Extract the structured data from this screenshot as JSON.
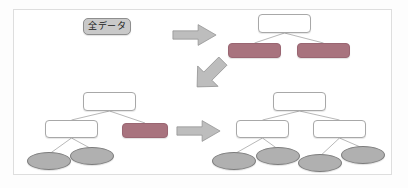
{
  "figure": {
    "title_label": "全データ",
    "colors": {
      "node_white_fill": "#ffffff",
      "node_white_stroke": "#a8a8a8",
      "node_rose_fill": "#a8737e",
      "node_rose_stroke": "#9a6672",
      "leaf_fill": "#b0b0b0",
      "leaf_stroke": "#7d7d7d",
      "arrow_fill": "#bdbdbd",
      "arrow_stroke": "#8f8f8f",
      "tag_fill": "#c9c9c9",
      "frame_stroke": "#dedede",
      "background": "#ffffff",
      "edge_stroke": "#9a9a9a"
    },
    "trees": [
      {
        "id": "tree-top-right",
        "caption": "",
        "nodes": [
          {
            "id": "tr-root",
            "kind": "rect",
            "fill": "white",
            "label": "",
            "x": 258,
            "y": 14,
            "w": 53,
            "h": 19
          },
          {
            "id": "tr-left",
            "kind": "rect",
            "fill": "rose",
            "label": "",
            "x": 228,
            "y": 43,
            "w": 53,
            "h": 15
          },
          {
            "id": "tr-right",
            "kind": "rect",
            "fill": "rose",
            "label": "",
            "x": 297,
            "y": 43,
            "w": 53,
            "h": 15
          }
        ],
        "edges": [
          {
            "from": "tr-root",
            "to": "tr-left"
          },
          {
            "from": "tr-root",
            "to": "tr-right"
          }
        ]
      },
      {
        "id": "tree-bottom-left",
        "caption": "",
        "nodes": [
          {
            "id": "bl-root",
            "kind": "rect",
            "fill": "white",
            "label": "",
            "x": 83,
            "y": 92,
            "w": 53,
            "h": 19
          },
          {
            "id": "bl-left",
            "kind": "rect",
            "fill": "white",
            "label": "",
            "x": 45,
            "y": 120,
            "w": 53,
            "h": 18
          },
          {
            "id": "bl-right",
            "kind": "rect",
            "fill": "rose",
            "label": "",
            "x": 122,
            "y": 123,
            "w": 46,
            "h": 15
          },
          {
            "id": "bl-leaf1",
            "kind": "ellipse",
            "fill": "gray",
            "label": "",
            "x": 27,
            "y": 152,
            "w": 44,
            "h": 18
          },
          {
            "id": "bl-leaf2",
            "kind": "ellipse",
            "fill": "gray",
            "label": "",
            "x": 70,
            "y": 147,
            "w": 44,
            "h": 18
          }
        ],
        "edges": [
          {
            "from": "bl-root",
            "to": "bl-left"
          },
          {
            "from": "bl-root",
            "to": "bl-right"
          },
          {
            "from": "bl-left",
            "to": "bl-leaf1"
          },
          {
            "from": "bl-left",
            "to": "bl-leaf2"
          }
        ]
      },
      {
        "id": "tree-bottom-right",
        "caption": "",
        "nodes": [
          {
            "id": "br-root",
            "kind": "rect",
            "fill": "white",
            "label": "",
            "x": 273,
            "y": 92,
            "w": 53,
            "h": 19
          },
          {
            "id": "br-left",
            "kind": "rect",
            "fill": "white",
            "label": "",
            "x": 236,
            "y": 120,
            "w": 53,
            "h": 18
          },
          {
            "id": "br-right",
            "kind": "rect",
            "fill": "white",
            "label": "",
            "x": 313,
            "y": 120,
            "w": 53,
            "h": 18
          },
          {
            "id": "br-leaf1",
            "kind": "ellipse",
            "fill": "gray",
            "label": "",
            "x": 212,
            "y": 152,
            "w": 44,
            "h": 18
          },
          {
            "id": "br-leaf2",
            "kind": "ellipse",
            "fill": "gray",
            "label": "",
            "x": 256,
            "y": 147,
            "w": 44,
            "h": 18
          },
          {
            "id": "br-leaf3",
            "kind": "ellipse",
            "fill": "gray",
            "label": "",
            "x": 298,
            "y": 154,
            "w": 44,
            "h": 18
          },
          {
            "id": "br-leaf4",
            "kind": "ellipse",
            "fill": "gray",
            "label": "",
            "x": 341,
            "y": 146,
            "w": 44,
            "h": 18
          }
        ],
        "edges": [
          {
            "from": "br-root",
            "to": "br-left"
          },
          {
            "from": "br-root",
            "to": "br-right"
          },
          {
            "from": "br-left",
            "to": "br-leaf1"
          },
          {
            "from": "br-left",
            "to": "br-leaf2"
          },
          {
            "from": "br-right",
            "to": "br-leaf3"
          },
          {
            "from": "br-right",
            "to": "br-leaf4"
          }
        ]
      }
    ],
    "arrows": [
      {
        "id": "arrow-right-top",
        "direction": "right",
        "x": 172,
        "y": 22,
        "w": 45,
        "h": 26
      },
      {
        "id": "arrow-down-left",
        "direction": "down-left",
        "x": 191,
        "y": 56,
        "w": 38,
        "h": 36
      },
      {
        "id": "arrow-right-bottom",
        "direction": "right",
        "x": 176,
        "y": 118,
        "w": 45,
        "h": 26
      }
    ],
    "tag": {
      "x": 83,
      "y": 18,
      "w": 48,
      "h": 17
    }
  }
}
